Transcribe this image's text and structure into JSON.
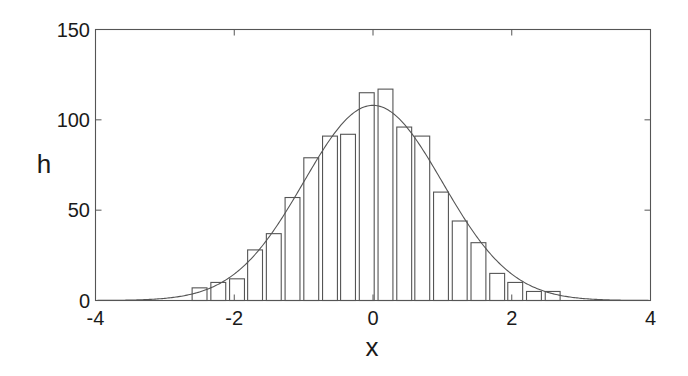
{
  "chart_data": {
    "type": "bar",
    "subtype": "histogram-with-fitted-normal-curve",
    "title": "",
    "xlabel": "x",
    "ylabel": "h",
    "xlim": [
      -4,
      4
    ],
    "ylim": [
      0,
      150
    ],
    "xticks": [
      -4,
      -2,
      0,
      2,
      4
    ],
    "yticks": [
      0,
      50,
      100,
      150
    ],
    "xtick_labels": [
      "-4",
      "-2",
      "0",
      "2",
      "4"
    ],
    "ytick_labels": [
      "0",
      "50",
      "100",
      "150"
    ],
    "grid": false,
    "legend": null,
    "bin_width": 0.268,
    "bin_centers": [
      -2.5,
      -2.23,
      -1.96,
      -1.7,
      -1.43,
      -1.16,
      -0.89,
      -0.62,
      -0.36,
      -0.09,
      0.18,
      0.45,
      0.71,
      0.98,
      1.25,
      1.52,
      1.79,
      2.05,
      2.32,
      2.59
    ],
    "series": [
      {
        "name": "histogram",
        "type": "bar",
        "values": [
          7,
          10,
          12,
          28,
          37,
          57,
          79,
          91,
          92,
          115,
          117,
          96,
          91,
          60,
          44,
          32,
          15,
          10,
          5,
          5
        ]
      },
      {
        "name": "normal fit",
        "type": "line",
        "function": "gaussian",
        "mean": 0,
        "std": 1,
        "peak": 108,
        "x_range": [
          -4,
          4
        ]
      }
    ]
  }
}
